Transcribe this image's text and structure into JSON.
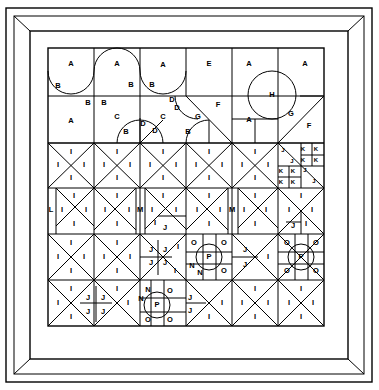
{
  "figure": {
    "frame": {
      "outer": {
        "x": 6,
        "y": 8,
        "w": 366,
        "h": 374
      },
      "inner": {
        "x": 30,
        "y": 31,
        "w": 318,
        "h": 328
      },
      "miter_corners": true,
      "stroke": "#000000",
      "background": "#ffffff"
    },
    "grid": {
      "x0": 48,
      "y0": 48,
      "x1": 324,
      "y1": 326,
      "cols": 6,
      "rows": 6,
      "cell_w": 46,
      "cell_h": 46.33,
      "row_lines": [
        48,
        96,
        143,
        188,
        234,
        280,
        326
      ],
      "col_lines": [
        48,
        94,
        140,
        186,
        232,
        278,
        324
      ]
    },
    "colors": {
      "line": "#000000",
      "fill": "#ffffff",
      "label": "#000000"
    }
  },
  "labels": {
    "top_band": [
      {
        "text": "A",
        "x": 71,
        "y": 64
      },
      {
        "text": "A",
        "x": 117,
        "y": 64
      },
      {
        "text": "A",
        "x": 163,
        "y": 65
      },
      {
        "text": "E",
        "x": 209,
        "y": 64
      },
      {
        "text": "A",
        "x": 249,
        "y": 64
      },
      {
        "text": "A",
        "x": 305,
        "y": 64
      },
      {
        "text": "B",
        "x": 58,
        "y": 86
      },
      {
        "text": "B",
        "x": 131,
        "y": 85
      },
      {
        "text": "B",
        "x": 152,
        "y": 85
      },
      {
        "text": "B",
        "x": 88,
        "y": 103
      },
      {
        "text": "B",
        "x": 104,
        "y": 103
      },
      {
        "text": "D",
        "x": 172,
        "y": 100
      },
      {
        "text": "D",
        "x": 177,
        "y": 108
      },
      {
        "text": "F",
        "x": 218,
        "y": 105
      },
      {
        "text": "H",
        "x": 272,
        "y": 95
      },
      {
        "text": "A",
        "x": 71,
        "y": 121
      },
      {
        "text": "C",
        "x": 117,
        "y": 117
      },
      {
        "text": "C",
        "x": 163,
        "y": 117
      },
      {
        "text": "G",
        "x": 198,
        "y": 117
      },
      {
        "text": "A",
        "x": 249,
        "y": 120
      },
      {
        "text": "G",
        "x": 291,
        "y": 114
      },
      {
        "text": "F",
        "x": 309,
        "y": 126
      },
      {
        "text": "B",
        "x": 126,
        "y": 132
      },
      {
        "text": "D",
        "x": 143,
        "y": 124
      },
      {
        "text": "D",
        "x": 155,
        "y": 131
      },
      {
        "text": "B",
        "x": 188,
        "y": 132
      }
    ],
    "k_block": [
      {
        "text": "J",
        "x": 283,
        "y": 150
      },
      {
        "text": "K",
        "x": 303,
        "y": 149
      },
      {
        "text": "K",
        "x": 316,
        "y": 149
      },
      {
        "text": "J",
        "x": 292,
        "y": 161
      },
      {
        "text": "K",
        "x": 303,
        "y": 160
      },
      {
        "text": "K",
        "x": 316,
        "y": 160
      },
      {
        "text": "K",
        "x": 281,
        "y": 171
      },
      {
        "text": "K",
        "x": 293,
        "y": 171
      },
      {
        "text": "J",
        "x": 305,
        "y": 170
      },
      {
        "text": "K",
        "x": 281,
        "y": 182
      },
      {
        "text": "K",
        "x": 293,
        "y": 182
      },
      {
        "text": "J",
        "x": 314,
        "y": 181
      }
    ],
    "grid_cells": [
      {
        "text": "I",
        "x": 71,
        "y": 152
      },
      {
        "text": "I",
        "x": 58,
        "y": 165
      },
      {
        "text": "I",
        "x": 84,
        "y": 165
      },
      {
        "text": "I",
        "x": 71,
        "y": 178
      },
      {
        "text": "I",
        "x": 117,
        "y": 152
      },
      {
        "text": "I",
        "x": 104,
        "y": 165
      },
      {
        "text": "I",
        "x": 130,
        "y": 165
      },
      {
        "text": "I",
        "x": 117,
        "y": 178
      },
      {
        "text": "I",
        "x": 163,
        "y": 152
      },
      {
        "text": "I",
        "x": 150,
        "y": 165
      },
      {
        "text": "I",
        "x": 176,
        "y": 165
      },
      {
        "text": "I",
        "x": 163,
        "y": 178
      },
      {
        "text": "I",
        "x": 209,
        "y": 152
      },
      {
        "text": "I",
        "x": 196,
        "y": 165
      },
      {
        "text": "I",
        "x": 222,
        "y": 165
      },
      {
        "text": "I",
        "x": 209,
        "y": 178
      },
      {
        "text": "I",
        "x": 255,
        "y": 152
      },
      {
        "text": "I",
        "x": 242,
        "y": 165
      },
      {
        "text": "I",
        "x": 268,
        "y": 165
      },
      {
        "text": "I",
        "x": 255,
        "y": 178
      },
      {
        "text": "I",
        "x": 74,
        "y": 196
      },
      {
        "text": "I",
        "x": 62,
        "y": 210
      },
      {
        "text": "I",
        "x": 86,
        "y": 210
      },
      {
        "text": "I",
        "x": 74,
        "y": 224
      },
      {
        "text": "L",
        "x": 51,
        "y": 210
      },
      {
        "text": "I",
        "x": 117,
        "y": 196
      },
      {
        "text": "I",
        "x": 105,
        "y": 210
      },
      {
        "text": "I",
        "x": 129,
        "y": 210
      },
      {
        "text": "I",
        "x": 117,
        "y": 224
      },
      {
        "text": "M",
        "x": 140,
        "y": 210
      },
      {
        "text": "I",
        "x": 163,
        "y": 196
      },
      {
        "text": "I",
        "x": 152,
        "y": 210
      },
      {
        "text": "I",
        "x": 176,
        "y": 210
      },
      {
        "text": "I",
        "x": 155,
        "y": 223
      },
      {
        "text": "J",
        "x": 165,
        "y": 228
      },
      {
        "text": "I",
        "x": 209,
        "y": 196
      },
      {
        "text": "I",
        "x": 197,
        "y": 210
      },
      {
        "text": "I",
        "x": 220,
        "y": 210
      },
      {
        "text": "I",
        "x": 209,
        "y": 224
      },
      {
        "text": "M",
        "x": 232,
        "y": 210
      },
      {
        "text": "I",
        "x": 255,
        "y": 196
      },
      {
        "text": "I",
        "x": 244,
        "y": 210
      },
      {
        "text": "I",
        "x": 266,
        "y": 210
      },
      {
        "text": "I",
        "x": 255,
        "y": 224
      },
      {
        "text": "I",
        "x": 301,
        "y": 196
      },
      {
        "text": "I",
        "x": 289,
        "y": 210
      },
      {
        "text": "I",
        "x": 312,
        "y": 210
      },
      {
        "text": "J",
        "x": 293,
        "y": 226
      },
      {
        "text": "I",
        "x": 306,
        "y": 224
      },
      {
        "text": "I",
        "x": 71,
        "y": 243
      },
      {
        "text": "I",
        "x": 58,
        "y": 257
      },
      {
        "text": "I",
        "x": 84,
        "y": 257
      },
      {
        "text": "I",
        "x": 71,
        "y": 271
      },
      {
        "text": "I",
        "x": 117,
        "y": 243
      },
      {
        "text": "I",
        "x": 104,
        "y": 257
      },
      {
        "text": "I",
        "x": 130,
        "y": 257
      },
      {
        "text": "I",
        "x": 117,
        "y": 271
      },
      {
        "text": "J",
        "x": 151,
        "y": 250
      },
      {
        "text": "J",
        "x": 165,
        "y": 250
      },
      {
        "text": "I",
        "x": 178,
        "y": 247
      },
      {
        "text": "J",
        "x": 151,
        "y": 263
      },
      {
        "text": "J",
        "x": 165,
        "y": 263
      },
      {
        "text": "I",
        "x": 175,
        "y": 271
      },
      {
        "text": "O",
        "x": 194,
        "y": 243
      },
      {
        "text": "O",
        "x": 224,
        "y": 243
      },
      {
        "text": "P",
        "x": 209,
        "y": 257
      },
      {
        "text": "N",
        "x": 192,
        "y": 266
      },
      {
        "text": "N",
        "x": 200,
        "y": 273
      },
      {
        "text": "O",
        "x": 224,
        "y": 271
      },
      {
        "text": "J",
        "x": 245,
        "y": 250
      },
      {
        "text": "J",
        "x": 245,
        "y": 265
      },
      {
        "text": "I",
        "x": 268,
        "y": 257
      },
      {
        "text": "O",
        "x": 287,
        "y": 243
      },
      {
        "text": "O",
        "x": 316,
        "y": 243
      },
      {
        "text": "P",
        "x": 301,
        "y": 257
      },
      {
        "text": "O",
        "x": 287,
        "y": 271
      },
      {
        "text": "O",
        "x": 316,
        "y": 271
      },
      {
        "text": "I",
        "x": 58,
        "y": 303
      },
      {
        "text": "I",
        "x": 71,
        "y": 289
      },
      {
        "text": "I",
        "x": 71,
        "y": 317
      },
      {
        "text": "J",
        "x": 88,
        "y": 298
      },
      {
        "text": "J",
        "x": 103,
        "y": 298
      },
      {
        "text": "J",
        "x": 88,
        "y": 312
      },
      {
        "text": "J",
        "x": 103,
        "y": 312
      },
      {
        "text": "I",
        "x": 117,
        "y": 289
      },
      {
        "text": "I",
        "x": 128,
        "y": 303
      },
      {
        "text": "N",
        "x": 148,
        "y": 290
      },
      {
        "text": "N",
        "x": 141,
        "y": 299
      },
      {
        "text": "O",
        "x": 170,
        "y": 291
      },
      {
        "text": "P",
        "x": 157,
        "y": 305
      },
      {
        "text": "O",
        "x": 148,
        "y": 320
      },
      {
        "text": "O",
        "x": 170,
        "y": 320
      },
      {
        "text": "J",
        "x": 190,
        "y": 298
      },
      {
        "text": "J",
        "x": 190,
        "y": 311
      },
      {
        "text": "I",
        "x": 209,
        "y": 317
      },
      {
        "text": "I",
        "x": 222,
        "y": 303
      },
      {
        "text": "I",
        "x": 255,
        "y": 289
      },
      {
        "text": "I",
        "x": 242,
        "y": 303
      },
      {
        "text": "I",
        "x": 268,
        "y": 303
      },
      {
        "text": "I",
        "x": 255,
        "y": 317
      },
      {
        "text": "I",
        "x": 301,
        "y": 289
      },
      {
        "text": "I",
        "x": 289,
        "y": 303
      },
      {
        "text": "I",
        "x": 313,
        "y": 303
      },
      {
        "text": "I",
        "x": 301,
        "y": 317
      }
    ]
  },
  "legend_keys": [
    "A",
    "B",
    "C",
    "D",
    "E",
    "F",
    "G",
    "H",
    "I",
    "J",
    "K",
    "L",
    "M",
    "N",
    "O",
    "P"
  ]
}
